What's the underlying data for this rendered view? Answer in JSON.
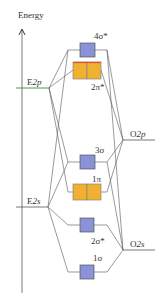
{
  "axis": {
    "label": "Energy"
  },
  "atomic_levels": {
    "e2p": {
      "label": "E2p",
      "element": "E",
      "orbital": "2p",
      "color": "#4a9a4a"
    },
    "e2s": {
      "label": "E2s",
      "element": "E",
      "orbital": "2s"
    },
    "o2p": {
      "label": "O2p",
      "element": "O",
      "orbital": "2p"
    },
    "o2s": {
      "label": "O2s",
      "element": "O",
      "orbital": "2s"
    }
  },
  "molecular_orbitals": [
    {
      "id": "4sigma_star",
      "label": "4σ*",
      "type": "sigma",
      "degeneracy": 1,
      "color": "#8b93d8"
    },
    {
      "id": "2pi_star",
      "label": "2π*",
      "type": "pi",
      "degeneracy": 2,
      "color": "#f0b030"
    },
    {
      "id": "3sigma",
      "label": "3σ",
      "type": "sigma",
      "degeneracy": 1,
      "color": "#8b93d8"
    },
    {
      "id": "1pi",
      "label": "1π",
      "type": "pi",
      "degeneracy": 2,
      "color": "#f0b030"
    },
    {
      "id": "2sigma_star",
      "label": "2σ*",
      "type": "sigma",
      "degeneracy": 1,
      "color": "#8b93d8"
    },
    {
      "id": "1sigma",
      "label": "1σ",
      "type": "sigma",
      "degeneracy": 1,
      "color": "#8b93d8"
    }
  ],
  "colors": {
    "sigma_fill": "#8b93d8",
    "pi_fill": "#f0b030",
    "pi_top_border": "#e05030",
    "line": "#555555",
    "e2p_line": "#4a9a4a"
  }
}
